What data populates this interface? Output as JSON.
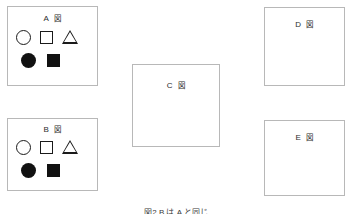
{
  "figure": {
    "caption": "図2 B は A と同じ",
    "background_color": "#ffffff",
    "border_color": "#b8b8b8",
    "shape_color": "#111111"
  },
  "panels": [
    {
      "id": "a",
      "letter": "A",
      "glyph": "図",
      "has_shapes": true,
      "shapes_outline": [
        "circle",
        "square",
        "triangle"
      ],
      "shapes_filled": [
        "circle",
        "square"
      ]
    },
    {
      "id": "b",
      "letter": "B",
      "glyph": "図",
      "has_shapes": true,
      "shapes_outline": [
        "circle",
        "square",
        "triangle"
      ],
      "shapes_filled": [
        "circle",
        "square"
      ]
    },
    {
      "id": "c",
      "letter": "C",
      "glyph": "図",
      "has_shapes": false,
      "shapes_outline": [],
      "shapes_filled": []
    },
    {
      "id": "d",
      "letter": "D",
      "glyph": "図",
      "has_shapes": false,
      "shapes_outline": [],
      "shapes_filled": []
    },
    {
      "id": "e",
      "letter": "E",
      "glyph": "図",
      "has_shapes": false,
      "shapes_outline": [],
      "shapes_filled": []
    }
  ]
}
